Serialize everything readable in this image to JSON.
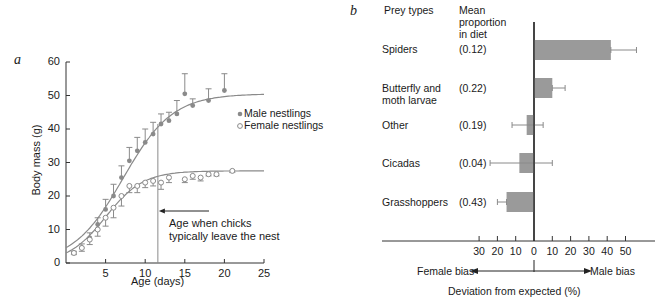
{
  "chart_data": [
    {
      "panel": "a",
      "type": "scatter",
      "title": "",
      "xlabel": "Age (days)",
      "ylabel": "Body mass (g)",
      "xlim": [
        0,
        25
      ],
      "ylim": [
        0,
        60
      ],
      "xticks": [
        5,
        10,
        15,
        20,
        25
      ],
      "yticks": [
        0,
        10,
        20,
        30,
        40,
        50,
        60
      ],
      "grid": false,
      "legend_position": "right",
      "series": [
        {
          "name": "Male nestlings",
          "marker": "filled-circle",
          "x": [
            1,
            2,
            3,
            4,
            5,
            6,
            7,
            8,
            9,
            10,
            11,
            12,
            13,
            14,
            15,
            16,
            18,
            20
          ],
          "y": [
            3,
            4.5,
            7.5,
            11.5,
            16,
            20,
            25.5,
            30.5,
            33.5,
            36,
            38.5,
            41.5,
            42.5,
            44.5,
            50.5,
            47,
            48.5,
            51.5
          ],
          "err_upper": [
            0.5,
            1.2,
            1.5,
            2,
            3,
            3.5,
            3.5,
            4,
            4,
            4,
            3.5,
            3,
            2.5,
            4,
            6,
            2,
            3.5,
            5
          ],
          "fit_asymptote": 50.5
        },
        {
          "name": "Female nestlings",
          "marker": "open-circle",
          "x": [
            1,
            2,
            3,
            4,
            5,
            6,
            7,
            8,
            9,
            10,
            11,
            12,
            13,
            15,
            16,
            17,
            18,
            19,
            21
          ],
          "y": [
            3,
            4.5,
            7,
            10,
            13.5,
            16.5,
            20,
            23,
            23,
            24,
            24.5,
            24,
            25.5,
            25,
            26,
            25.5,
            26.5,
            26.5,
            27.5
          ],
          "err_lower": [
            0.5,
            1,
            1.5,
            2,
            2.5,
            3,
            3,
            2,
            2,
            1.5,
            1.5,
            2,
            1.5,
            1,
            1,
            1,
            0.5,
            0.5,
            0.5
          ],
          "fit_asymptote": 27.5
        }
      ],
      "annotations": [
        {
          "text": "Age when chicks typically leave the nest",
          "x": 11.6,
          "type": "vertical-line-with-arrow"
        }
      ]
    },
    {
      "panel": "b",
      "type": "bar",
      "orientation": "horizontal",
      "xlabel": "Deviation from expected (%)",
      "xlim": [
        -35,
        60
      ],
      "xticks_left": [
        30,
        20,
        10
      ],
      "xticks_right": [
        0,
        10,
        20,
        30,
        40,
        50
      ],
      "column_headers": [
        "Prey types",
        "Mean proportion in diet"
      ],
      "categories": [
        "Spiders",
        "Butterfly and moth larvae",
        "Other",
        "Cicadas",
        "Grasshoppers"
      ],
      "proportions": [
        "(0.12)",
        "(0.22)",
        "(0.19)",
        "(0.04)",
        "(0.43)"
      ],
      "values": [
        42,
        10,
        -4,
        -8,
        -15
      ],
      "err_low": [
        42,
        10,
        -12,
        -24,
        -20
      ],
      "err_high": [
        56,
        17,
        5,
        10,
        -15
      ],
      "annotations": [
        "Female bias",
        "Male bias"
      ]
    }
  ],
  "panel_a": {
    "label": "a",
    "ylabel": "Body mass (g)",
    "xlabel": "Age (days)",
    "yticks": [
      "0",
      "10",
      "20",
      "30",
      "40",
      "50",
      "60"
    ],
    "xticks": [
      "5",
      "10",
      "15",
      "20",
      "25"
    ],
    "legend_male": "Male nestlings",
    "legend_female": "Female nestlings",
    "annot_line1": "Age when chicks",
    "annot_line2": "typically leave the nest"
  },
  "panel_b": {
    "label": "b",
    "col1": "Prey types",
    "col2_l1": "Mean",
    "col2_l2": "proportion",
    "col2_l3": "in diet",
    "rows": [
      {
        "name1": "Spiders",
        "name2": "",
        "prop": "(0.12)"
      },
      {
        "name1": "Butterfly and",
        "name2": "moth larvae",
        "prop": "(0.22)"
      },
      {
        "name1": "Other",
        "name2": "",
        "prop": "(0.19)"
      },
      {
        "name1": "Cicadas",
        "name2": "",
        "prop": "(0.04)"
      },
      {
        "name1": "Grasshoppers",
        "name2": "",
        "prop": "(0.43)"
      }
    ],
    "ticks": [
      "30",
      "20",
      "10",
      "0",
      "10",
      "20",
      "30",
      "40",
      "50"
    ],
    "female_bias": "Female bias",
    "male_bias": "Male bias",
    "xlabel": "Deviation from expected (%)"
  },
  "colors": {
    "male": "#8a8a8a",
    "female": "#8a8a8a",
    "bar": "#9a9a9a",
    "axis": "#333333"
  }
}
